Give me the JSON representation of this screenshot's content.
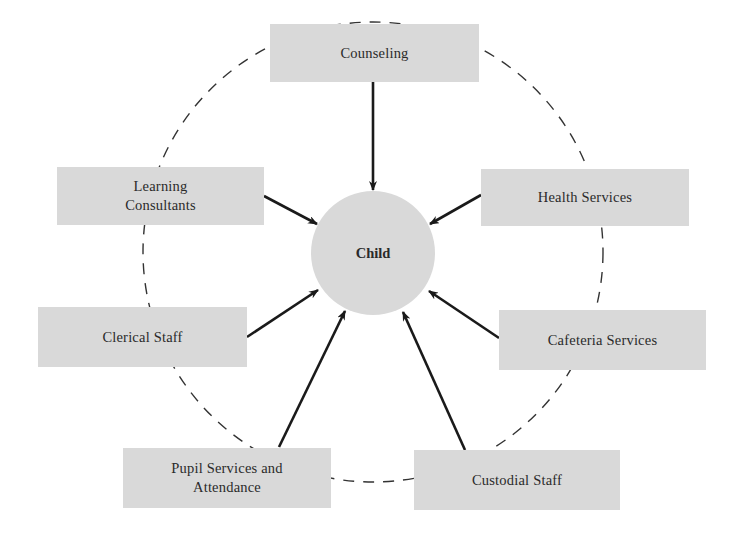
{
  "diagram": {
    "type": "hub-and-spoke",
    "hub": {
      "label": "Child"
    },
    "colors": {
      "box_fill": "#d9d9d9",
      "arrow": "#1a1a1a",
      "dashed_ring": "#333333",
      "text": "#2a2a2a"
    },
    "nodes": [
      {
        "id": "counseling",
        "label": "Counseling"
      },
      {
        "id": "learning",
        "label": "Learning\nConsultants"
      },
      {
        "id": "health",
        "label": "Health Services"
      },
      {
        "id": "clerical",
        "label": "Clerical Staff"
      },
      {
        "id": "cafeteria",
        "label": "Cafeteria Services"
      },
      {
        "id": "pupil",
        "label": "Pupil Services and\nAttendance"
      },
      {
        "id": "custodial",
        "label": "Custodial Staff"
      }
    ],
    "edges": [
      {
        "from": "counseling",
        "to": "child",
        "style": "arrow"
      },
      {
        "from": "learning",
        "to": "child",
        "style": "arrow"
      },
      {
        "from": "health",
        "to": "child",
        "style": "arrow"
      },
      {
        "from": "clerical",
        "to": "child",
        "style": "arrow"
      },
      {
        "from": "cafeteria",
        "to": "child",
        "style": "arrow"
      },
      {
        "from": "pupil",
        "to": "child",
        "style": "arrow"
      },
      {
        "from": "custodial",
        "to": "child",
        "style": "arrow"
      }
    ],
    "ring": {
      "style": "dashed",
      "connects": "all outer nodes"
    }
  }
}
